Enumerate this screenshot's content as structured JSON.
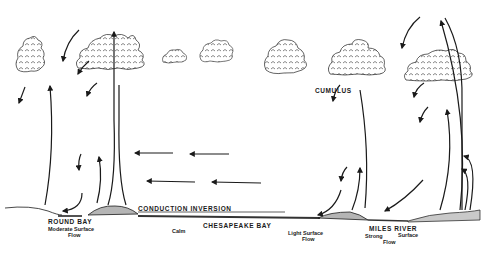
{
  "diagram": {
    "type": "meteorological cross-section sketch",
    "colors": {
      "ink": "#1a1a1a",
      "land_fill": "#b5b5b5",
      "water": "#333333",
      "background": "#ffffff"
    },
    "labels": {
      "round_bay": "ROUND  BAY",
      "moderate_flow_line1": "Moderate  Surface",
      "moderate_flow_line2": "Flow",
      "conduction_inversion": "CONDUCTION   INVERSION",
      "chesapeake_bay": "CHESAPEAKE   BAY",
      "calm": "Calm",
      "light_flow_line1": "Light  Surface",
      "light_flow_line2": "Flow",
      "miles_river": "MILES  RIVER",
      "strong_flow_line1": "Strong",
      "strong_flow_line2": "Surface",
      "strong_flow_line3": "Flow",
      "cumulus": "CUMULUS"
    },
    "clouds": [
      {
        "name": "cloud-left-small-tower",
        "x": 30,
        "y": 50
      },
      {
        "name": "cloud-left-large",
        "x": 110,
        "y": 50
      },
      {
        "name": "cloud-mid-tiny",
        "x": 172,
        "y": 55
      },
      {
        "name": "cloud-mid-small",
        "x": 215,
        "y": 53
      },
      {
        "name": "cloud-mid-medium",
        "x": 285,
        "y": 55
      },
      {
        "name": "cloud-cumulus",
        "x": 355,
        "y": 60
      },
      {
        "name": "cloud-right-large",
        "x": 440,
        "y": 65
      }
    ],
    "horizontal_flow_arrows": 4
  }
}
